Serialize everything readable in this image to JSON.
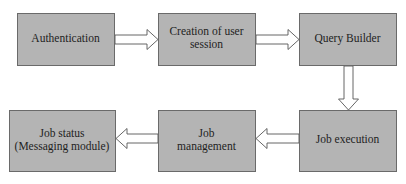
{
  "diagram": {
    "type": "flowchart",
    "colors": {
      "box_fill": "#b4b4b4",
      "box_border": "#6a6a6a",
      "arrow_fill": "#ffffff",
      "arrow_stroke": "#555555",
      "text": "#1e1e1e"
    },
    "nodes": [
      {
        "id": "authentication",
        "lines": [
          "Authentication"
        ]
      },
      {
        "id": "creation-of-user-session",
        "lines": [
          "Creation of user",
          "session"
        ]
      },
      {
        "id": "query-builder",
        "lines": [
          "Query Builder"
        ]
      },
      {
        "id": "job-execution",
        "lines": [
          "Job execution"
        ]
      },
      {
        "id": "job-management",
        "lines": [
          "Job",
          "management"
        ]
      },
      {
        "id": "job-status",
        "lines": [
          "Job status",
          "(Messaging module)"
        ]
      }
    ],
    "edges": [
      {
        "from": "authentication",
        "to": "creation-of-user-session",
        "direction": "right"
      },
      {
        "from": "creation-of-user-session",
        "to": "query-builder",
        "direction": "right"
      },
      {
        "from": "query-builder",
        "to": "job-execution",
        "direction": "down"
      },
      {
        "from": "job-execution",
        "to": "job-management",
        "direction": "left"
      },
      {
        "from": "job-management",
        "to": "job-status",
        "direction": "left"
      }
    ]
  }
}
